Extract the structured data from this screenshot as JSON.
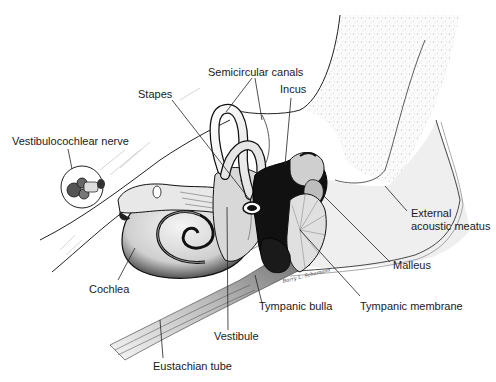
{
  "diagram": {
    "type": "anatomical illustration",
    "labels": {
      "semicircular_canals": "Semicircular canals",
      "stapes": "Stapes",
      "incus": "Incus",
      "vestibulocochlear_nerve": "Vestibulocochlear nerve",
      "external_acoustic_meatus_line1": "External",
      "external_acoustic_meatus_line2": "acoustic meatus",
      "malleus": "Malleus",
      "cochlea": "Cochlea",
      "tympanic_bulla": "Tympanic bulla",
      "tympanic_membrane": "Tympanic membrane",
      "vestibule": "Vestibule",
      "eustachian_tube": "Eustachian tube"
    },
    "signature": "Barry L. Schumann"
  }
}
